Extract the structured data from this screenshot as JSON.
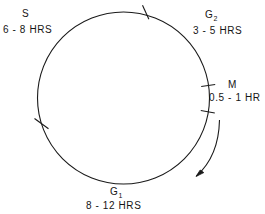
{
  "diagram": {
    "type": "cell-cycle-circle",
    "stroke_color": "#1a1a1a",
    "background_color": "#ffffff",
    "direction": "clockwise",
    "circle": {
      "cx": 123.5,
      "cy": 98,
      "r": 86
    },
    "phases": [
      {
        "id": "s",
        "name": "S",
        "duration": "6 - 8 HRS",
        "position": "upper-left"
      },
      {
        "id": "g2",
        "name": "G",
        "subscript": "2",
        "duration": "3 - 5 HRS",
        "position": "upper-right"
      },
      {
        "id": "m",
        "name": "M",
        "duration": "0.5 - 1 HR",
        "position": "right"
      },
      {
        "id": "g1",
        "name": "G",
        "subscript": "1",
        "duration": "8 - 12 HRS",
        "position": "bottom"
      }
    ],
    "tick_marks": [
      {
        "id": "tick-top",
        "angle_deg": -73,
        "label": "boundary-s-g2"
      },
      {
        "id": "tick-right-upper",
        "angle_deg": -8,
        "label": "boundary-g2-m"
      },
      {
        "id": "tick-right-lower",
        "angle_deg": 9,
        "label": "boundary-m-g1"
      },
      {
        "id": "tick-left-lower",
        "angle_deg": 162,
        "label": "boundary-g1-s"
      }
    ],
    "arrow": {
      "id": "direction-arrow",
      "points": "counterclockwise-on-screen-down-left",
      "label": ""
    }
  }
}
